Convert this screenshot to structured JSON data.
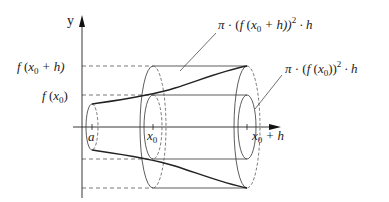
{
  "axes": {
    "y_label": "y",
    "x_tick_labels": {
      "a": "a",
      "x0": "x",
      "x0_sub": "0",
      "x0h": "x",
      "x0h_sub": "0",
      "x0h_rest": " + h"
    }
  },
  "y_labels": {
    "f_x0_h": {
      "f": "f",
      "open": " (",
      "x": "x",
      "sub": "0",
      "rest": " + h)"
    },
    "f_x0": {
      "f": "f",
      "open": " (",
      "x": "x",
      "sub": "0",
      "close": ")"
    }
  },
  "annotations": {
    "outer_volume": {
      "pi": "π",
      "dot1": " · (",
      "f": "f",
      "open": " (",
      "x": "x",
      "sub": "0",
      "rest": " + h))",
      "sup": "2",
      "tail": " · h"
    },
    "inner_volume": {
      "pi": "π",
      "dot1": " · (",
      "f": "f",
      "open": " (",
      "x": "x",
      "sub": "0",
      "rest": "))",
      "sup": "2",
      "tail": " · h"
    }
  },
  "colors": {
    "stroke": "#333333",
    "dashed": "#555555",
    "text": "#1a1a1a"
  }
}
